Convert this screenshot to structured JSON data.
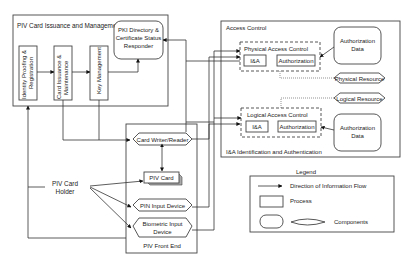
{
  "issuance": {
    "title": "PIV Card Issuance and Management",
    "identity_proofing": "Identity Proofing & Registration",
    "card_issuance": "Card Issuance & Maintenance",
    "key_management": "Key Management",
    "pki_line1": "PKI Directory &",
    "pki_line2": "Certificate Status",
    "pki_line3": "Responder"
  },
  "access_control": {
    "title": "Access Control",
    "physical": {
      "title": "Physical Access Control",
      "ia": "I&A",
      "authorization": "Authorization",
      "auth_data_line1": "Authorization",
      "auth_data_line2": "Data",
      "resource": "Physical Resource"
    },
    "logical": {
      "title": "Logical Access Control",
      "ia": "I&A",
      "authorization": "Authorization",
      "auth_data_line1": "Authorization",
      "auth_data_line2": "Data",
      "resource": "Logical Resource"
    },
    "footnote": "I&A Identification and Authentication"
  },
  "front_end": {
    "title": "PIV Front End",
    "card_writer": "Card Writer/Reader",
    "piv_card": "PIV Card",
    "pin_input": "PIN Input Device",
    "biometric_line1": "Biometric Input",
    "biometric_line2": "Device"
  },
  "card_holder": {
    "line1": "PIV Card",
    "line2": "Holder"
  },
  "legend": {
    "title": "Legend",
    "flow": "Direction of Information Flow",
    "process": "Process",
    "components": "Components"
  }
}
